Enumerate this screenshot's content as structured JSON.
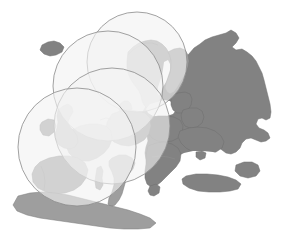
{
  "figure": {
    "width": 286,
    "height": 238,
    "background_color": "#ffffff"
  },
  "legend_colors": {
    "land_dark": "#828282",
    "land_mid": "#9e9e9e",
    "land_light": "#b4b4b4",
    "water": "#ffffff",
    "circle_fill": "#f2f2f2",
    "circle_stroke": "#8a8a8a",
    "border_stroke": "#7a7a7a"
  },
  "chart_data": {
    "type": "map",
    "projection": "pixel",
    "regions": [
      {
        "name": "russia-western",
        "shade": "dark"
      },
      {
        "name": "ukraine",
        "shade": "dark"
      },
      {
        "name": "belarus",
        "shade": "dark"
      },
      {
        "name": "baltic-states",
        "shade": "dark"
      },
      {
        "name": "poland",
        "shade": "dark"
      },
      {
        "name": "romania",
        "shade": "dark"
      },
      {
        "name": "bulgaria",
        "shade": "dark"
      },
      {
        "name": "turkey",
        "shade": "dark"
      },
      {
        "name": "balkans",
        "shade": "dark"
      },
      {
        "name": "italy",
        "shade": "mid"
      },
      {
        "name": "scandinavia",
        "shade": "mid"
      },
      {
        "name": "finland",
        "shade": "mid"
      },
      {
        "name": "iceland",
        "shade": "dark"
      },
      {
        "name": "british-isles",
        "shade": "mid"
      },
      {
        "name": "france",
        "shade": "mid"
      },
      {
        "name": "iberia",
        "shade": "mid"
      },
      {
        "name": "central-europe",
        "shade": "mid"
      },
      {
        "name": "north-africa",
        "shade": "mid"
      }
    ],
    "water_bodies": [
      "atlantic-ocean",
      "north-sea",
      "baltic-sea",
      "norwegian-sea",
      "mediterranean-sea",
      "black-sea",
      "gulf-of-bothnia"
    ],
    "overlay_circles": [
      {
        "id": "circle-1",
        "label": "coverage-circle-north",
        "cx": 137,
        "cy": 62,
        "r": 50
      },
      {
        "id": "circle-2",
        "label": "coverage-circle-northwest",
        "cx": 108,
        "cy": 86,
        "r": 55
      },
      {
        "id": "circle-3",
        "label": "coverage-circle-central",
        "cx": 112,
        "cy": 126,
        "r": 58
      },
      {
        "id": "circle-4",
        "label": "coverage-circle-west",
        "cx": 77,
        "cy": 147,
        "r": 59
      }
    ],
    "overlay_style": {
      "fill": "#f2f2f2",
      "fill_opacity": 0.62,
      "stroke": "#8a8a8a",
      "stroke_width": 0.8
    }
  }
}
